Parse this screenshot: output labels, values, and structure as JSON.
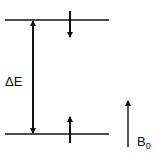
{
  "diagram": {
    "levels": [
      {
        "name": "upper",
        "spin": "down"
      },
      {
        "name": "lower",
        "spin": "up"
      }
    ],
    "energy_gap_label": "ΔE",
    "field_label_main": "B",
    "field_label_sub": "0",
    "colors": {
      "stroke": "#111111",
      "background": "#ffffff"
    }
  }
}
